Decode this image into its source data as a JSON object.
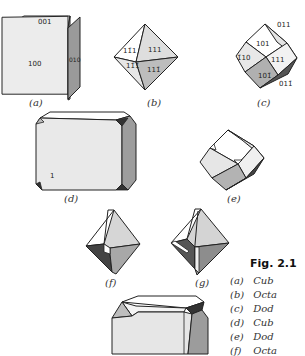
{
  "figure": {
    "number_label": "Fig. 2.1",
    "panels": [
      {
        "id": "a",
        "label": "(a)",
        "indices": [
          "001",
          "100",
          "010"
        ]
      },
      {
        "id": "b",
        "label": "(b)",
        "indices": [
          "11̄ 1",
          "111",
          "11̄ 1̄",
          "111̄"
        ]
      },
      {
        "id": "c",
        "label": "(c)",
        "indices": [
          "011",
          "101",
          "1̄1̄ 0",
          "111",
          "101̄",
          "011̄"
        ]
      },
      {
        "id": "d",
        "label": "(d)",
        "indices": [
          "1"
        ]
      },
      {
        "id": "e",
        "label": "(e)",
        "indices": []
      },
      {
        "id": "f",
        "label": "(f)",
        "indices": []
      },
      {
        "id": "g",
        "label": "(g)",
        "indices": []
      },
      {
        "id": "h",
        "label": "",
        "indices": []
      }
    ],
    "legend": [
      {
        "key": "(a)",
        "text": "Cub"
      },
      {
        "key": "(b)",
        "text": "Octa"
      },
      {
        "key": "(c)",
        "text": "Dod"
      },
      {
        "key": "(d)",
        "text": "Cub"
      },
      {
        "key": "(e)",
        "text": "Dod"
      },
      {
        "key": "(f)",
        "text": "Octa"
      }
    ],
    "labels_a": {
      "top": "001",
      "front": "100",
      "side": "010"
    },
    "labels_b": {
      "ul": "111̄",
      "ur": "111",
      "ll": "11̄1",
      "lr": "111̄"
    },
    "labels_c": {
      "top": "011",
      "ul": "101",
      "left": "1̄0",
      "center": "111",
      "bottom": "101̄",
      "br": "011̄"
    },
    "labels_d": {
      "mark": "1"
    }
  }
}
